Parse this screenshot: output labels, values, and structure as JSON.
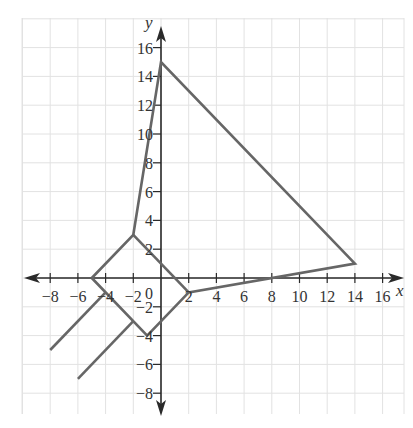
{
  "chart_data": {
    "type": "line",
    "title": "",
    "xlabel": "x",
    "ylabel": "y",
    "xlim": [
      -10,
      17.5
    ],
    "ylim": [
      -9.5,
      18
    ],
    "grid": true,
    "grid_step": 2,
    "x_ticks": [
      -8,
      -6,
      -4,
      -2,
      2,
      4,
      6,
      8,
      10,
      12,
      14,
      16
    ],
    "x_tick_labels": [
      "−8",
      "−6",
      "−4",
      "−2",
      "2",
      "4",
      "6",
      "8",
      "10",
      "12",
      "14",
      "16"
    ],
    "y_ticks": [
      16,
      14,
      12,
      10,
      8,
      6,
      4,
      2,
      -2,
      -4,
      -6,
      -8
    ],
    "y_tick_labels": [
      "16",
      "14",
      "12",
      "10",
      "8",
      "6",
      "4",
      "2",
      "−2",
      "−4",
      "−6",
      "−8"
    ],
    "origin_label": "0",
    "series": [
      {
        "name": "main-polyline",
        "points": [
          [
            -5,
            0
          ],
          [
            -2,
            3
          ],
          [
            0,
            15
          ],
          [
            14,
            1
          ],
          [
            2,
            -1
          ],
          [
            -1,
            -4
          ],
          [
            -5,
            0
          ]
        ]
      },
      {
        "name": "diamond-diagonal",
        "points": [
          [
            -2,
            3
          ],
          [
            2,
            -1
          ]
        ]
      },
      {
        "name": "parallel-line-1",
        "points": [
          [
            -8,
            -5
          ],
          [
            -4,
            -1
          ]
        ]
      },
      {
        "name": "parallel-line-2",
        "points": [
          [
            -6,
            -7
          ],
          [
            -2,
            -3
          ]
        ]
      }
    ]
  },
  "colors": {
    "grid": "#e2e2e2",
    "axis": "#2a2a2a",
    "plot_line": "#666666",
    "text": "#333333"
  }
}
